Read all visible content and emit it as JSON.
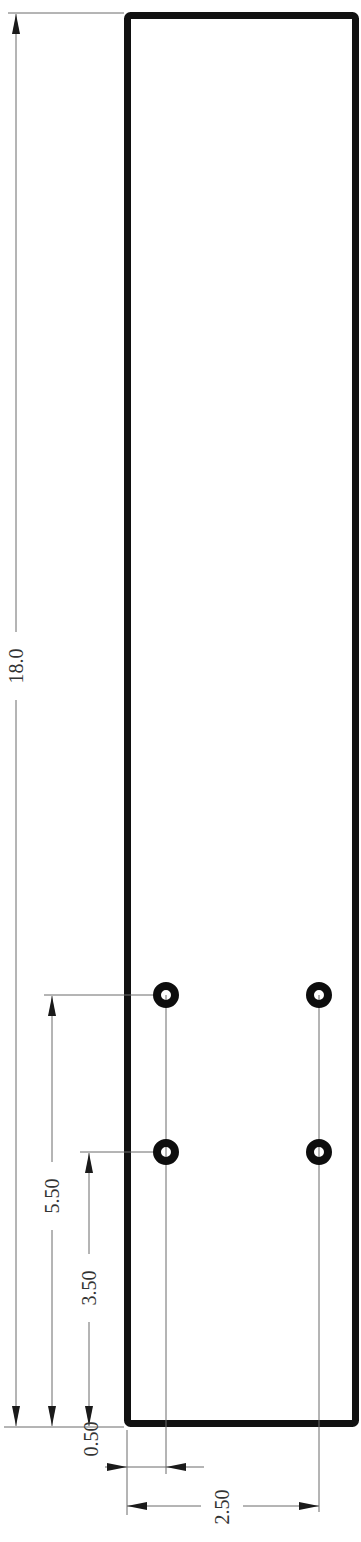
{
  "drawing": {
    "type": "engineering-drawing",
    "part_outline": {
      "shape": "rectangle",
      "color": "#111111"
    },
    "holes": [
      {
        "id": "hole-top-left"
      },
      {
        "id": "hole-top-right"
      },
      {
        "id": "hole-bottom-left"
      },
      {
        "id": "hole-bottom-right"
      }
    ],
    "dimensions": {
      "overall_length": "18.0",
      "hole_row_upper_offset": "5.50",
      "hole_row_lower_offset": "3.50",
      "hole_edge_offset": "0.50",
      "hole_spacing": "2.50"
    }
  }
}
